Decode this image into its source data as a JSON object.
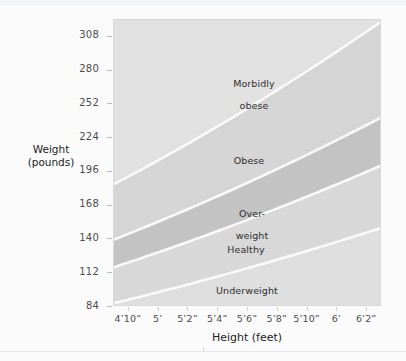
{
  "chart_data": {
    "type": "area",
    "title": "",
    "xlabel": "Height (feet)",
    "ylabel_line1": "Weight",
    "ylabel_line2": "(pounds)",
    "xtick_labels": [
      "4’10”",
      "5’",
      "5’2”",
      "5’4”",
      "5’6”",
      "5’8”",
      "5’10”",
      "6’",
      "6’2”"
    ],
    "xtick_inches": [
      58,
      60,
      62,
      64,
      66,
      68,
      70,
      72,
      74
    ],
    "ytick_labels": [
      "308",
      "280",
      "252",
      "224",
      "196",
      "168",
      "140",
      "112",
      "84"
    ],
    "ytick_values": [
      308,
      280,
      252,
      224,
      196,
      168,
      140,
      112,
      84
    ],
    "xlim_inches": [
      57,
      75
    ],
    "ylim": [
      84,
      322
    ],
    "grid": false,
    "legend": "none",
    "bands": [
      {
        "name": "underweight",
        "label": "Underweight",
        "color": "#e3e3e3",
        "bmi_range": [
          0,
          18.5
        ],
        "weight_at_4ft10": [
          84,
          88
        ],
        "weight_at_6ft2": [
          84,
          144
        ]
      },
      {
        "name": "healthy",
        "label": "Healthy",
        "color": "#dcdcdc",
        "bmi_range": [
          18.5,
          25
        ],
        "weight_at_4ft10": [
          88,
          119
        ],
        "weight_at_6ft2": [
          144,
          195
        ]
      },
      {
        "name": "overweight",
        "label": "Over-\nweight",
        "color": "#c6c6c6",
        "bmi_range": [
          25,
          30
        ],
        "weight_at_4ft10": [
          119,
          143
        ],
        "weight_at_6ft2": [
          195,
          234
        ]
      },
      {
        "name": "obese",
        "label": "Obese",
        "color": "#d9d9d9",
        "bmi_range": [
          30,
          40
        ],
        "weight_at_4ft10": [
          143,
          191
        ],
        "weight_at_6ft2": [
          234,
          312
        ]
      },
      {
        "name": "morbidly-obese",
        "label": "Morbidly\nobese",
        "color": "#e6e6e6",
        "bmi_range": [
          40,
          99
        ],
        "weight_at_4ft10": [
          191,
          322
        ],
        "weight_at_6ft2": [
          312,
          322
        ]
      }
    ],
    "divider_color": "#ffffff",
    "plot_background": "#e9e9e9",
    "page_background": "#fbfbfc",
    "axis_text_color": "#4c4c4c"
  },
  "labels": {
    "morbidly_obese_line1": "Morbidly",
    "morbidly_obese_line2": "obese",
    "obese": "Obese",
    "overweight_line1": "Over-",
    "overweight_line2": "weight",
    "healthy": "Healthy",
    "underweight": "Underweight"
  }
}
